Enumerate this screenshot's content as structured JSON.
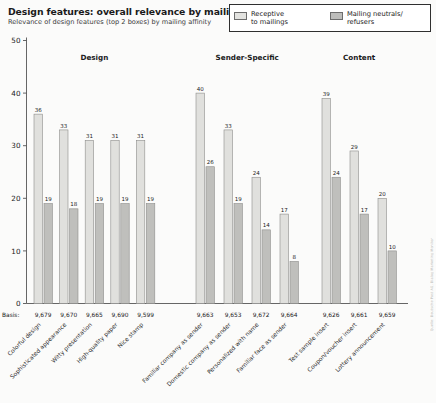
{
  "header": {
    "title": "Design features: overall relevance by mailing affinity in %",
    "subtitle": "Relevance of design features (top 2 boxes) by mailing affinity"
  },
  "legend": {
    "items": [
      {
        "label": "Receptive\nto mailings",
        "swatch": "light",
        "color": "#e3e3e0"
      },
      {
        "label": "Mailing neutrals/\nrefusers",
        "swatch": "dark",
        "color": "#bdbdbb"
      }
    ]
  },
  "axis": {
    "basis_caption": "Basis:",
    "y_ticks": [
      "0",
      "10",
      "20",
      "30",
      "40",
      "50"
    ]
  },
  "source_note": "Quelle: Deutsche Post AG, Dialog Marketing Monitor",
  "chart_data": {
    "type": "bar",
    "title": "Design features: overall relevance by mailing affinity in %",
    "subtitle": "Relevance of design features (top 2 boxes) by mailing affinity",
    "xlabel": "",
    "ylabel": "",
    "ylim": [
      0,
      50
    ],
    "yticks": [
      0,
      10,
      20,
      30,
      40,
      50
    ],
    "grid": false,
    "legend_position": "top-right",
    "groups": [
      {
        "name": "Design",
        "categories": [
          "Colorful design",
          "Sophisticated appearance",
          "Witty presentation",
          "High-quality paper",
          "Nice stamp"
        ],
        "basis": [
          "9,679",
          "9,670",
          "9,665",
          "9,690",
          "9,599"
        ],
        "series": [
          {
            "name": "Receptive to mailings",
            "values": [
              36,
              33,
              31,
              31,
              31
            ]
          },
          {
            "name": "Mailing neutrals/refusers",
            "values": [
              19,
              18,
              19,
              19,
              19
            ]
          }
        ]
      },
      {
        "name": "Sender-Specific",
        "categories": [
          "Familiar company as sender",
          "Domestic company as sender",
          "Personalized with name",
          "Familiar face as sender"
        ],
        "basis": [
          "9,663",
          "9,653",
          "9,672",
          "9,664"
        ],
        "series": [
          {
            "name": "Receptive to mailings",
            "values": [
              40,
              33,
              24,
              17
            ]
          },
          {
            "name": "Mailing neutrals/refusers",
            "values": [
              26,
              19,
              14,
              8
            ]
          }
        ]
      },
      {
        "name": "Content",
        "categories": [
          "Test sample insert",
          "Coupon/voucher insert",
          "Lottery announcement"
        ],
        "basis": [
          "9,626",
          "9,661",
          "9,659"
        ],
        "series": [
          {
            "name": "Receptive to mailings",
            "values": [
              39,
              29,
              20
            ]
          },
          {
            "name": "Mailing neutrals/refusers",
            "values": [
              24,
              17,
              10
            ]
          }
        ]
      }
    ]
  }
}
